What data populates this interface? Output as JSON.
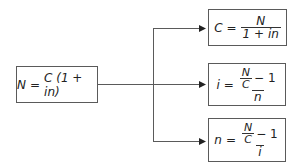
{
  "diagram": {
    "source_formula": {
      "lhs": "N",
      "equals": "=",
      "rhs": "C (1 + in)"
    },
    "derived_formulas": [
      {
        "id": "solve-for-C",
        "lhs": "C",
        "equals": "=",
        "numerator": "N",
        "denominator": "1 + in"
      },
      {
        "id": "solve-for-i",
        "lhs": "i",
        "equals": "=",
        "inner_numerator": "N",
        "inner_denominator": "C",
        "minus": "− 1",
        "denominator": "n"
      },
      {
        "id": "solve-for-n",
        "lhs": "n",
        "equals": "=",
        "inner_numerator": "N",
        "inner_denominator": "C",
        "minus": "− 1",
        "denominator": "i"
      }
    ],
    "colors": {
      "line": "#5a5a5a",
      "arrowhead": "#222222",
      "box_border": "#5a5a5a",
      "text": "#222222"
    }
  }
}
